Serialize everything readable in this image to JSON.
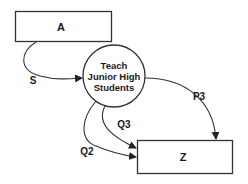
{
  "diagram": {
    "type": "flow",
    "nodes": [
      {
        "id": "A",
        "shape": "rectangle",
        "label": "A"
      },
      {
        "id": "process",
        "shape": "circle",
        "label_lines": [
          "Teach",
          "Junior High",
          "Students"
        ]
      },
      {
        "id": "Z",
        "shape": "rectangle",
        "label": "Z"
      }
    ],
    "edges": [
      {
        "from": "A",
        "to": "process",
        "label": "S"
      },
      {
        "from": "process",
        "to": "Z",
        "label": "P3"
      },
      {
        "from": "process",
        "to": "Z",
        "label": "Q3"
      },
      {
        "from": "process",
        "to": "Z",
        "label": "Q2"
      }
    ],
    "colors": {
      "stroke": "#333333",
      "text": "#1a1a1a",
      "background": "#ffffff"
    }
  }
}
